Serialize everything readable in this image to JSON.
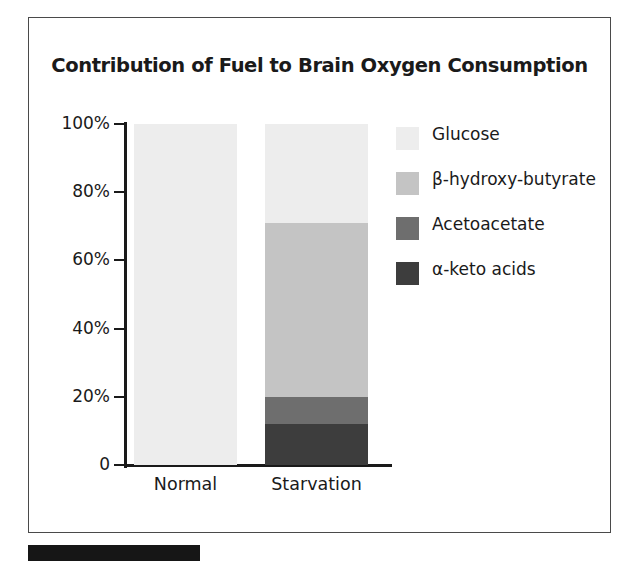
{
  "figure": {
    "title": "Contribution of Fuel to Brain Oxygen Consumption"
  },
  "axes": {
    "y_ticks": [
      "100%",
      "80%",
      "60%",
      "40%",
      "20%",
      "0"
    ],
    "x_labels": [
      "Normal",
      "Starvation"
    ]
  },
  "legend": {
    "items": [
      {
        "label": "Glucose",
        "color": "#ededed"
      },
      {
        "label": "β-hydroxy-butyrate",
        "color": "#c4c4c4"
      },
      {
        "label": "Acetoacetate",
        "color": "#6e6e6e"
      },
      {
        "label": "α-keto acids",
        "color": "#3d3d3d"
      }
    ]
  },
  "chart_data": {
    "type": "bar",
    "title": "Contribution of Fuel to Brain Oxygen Consumption",
    "xlabel": "",
    "ylabel": "",
    "stacked": true,
    "normalized_percent": true,
    "ylim": [
      0,
      100
    ],
    "yticks": [
      0,
      20,
      40,
      60,
      80,
      100
    ],
    "ytick_labels": [
      "0",
      "20%",
      "40%",
      "60%",
      "80%",
      "100%"
    ],
    "grid": false,
    "legend_position": "right",
    "categories": [
      "Normal",
      "Starvation"
    ],
    "series": [
      {
        "name": "α-keto acids",
        "color": "#3d3d3d",
        "values": [
          0,
          12
        ]
      },
      {
        "name": "Acetoacetate",
        "color": "#6e6e6e",
        "values": [
          0,
          8
        ]
      },
      {
        "name": "β-hydroxy-butyrate",
        "color": "#c4c4c4",
        "values": [
          0,
          51
        ]
      },
      {
        "name": "Glucose",
        "color": "#ededed",
        "values": [
          100,
          29
        ]
      }
    ]
  }
}
